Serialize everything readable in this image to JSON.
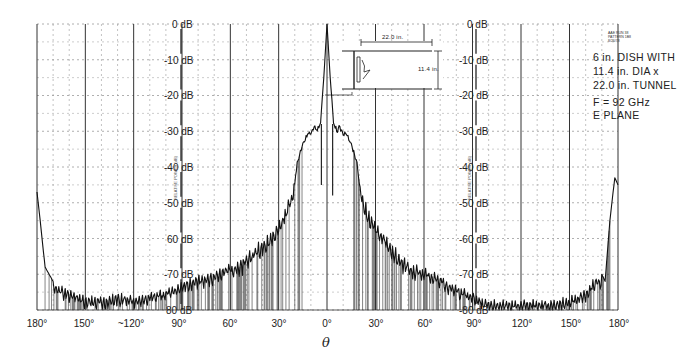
{
  "chart_data": {
    "type": "line",
    "xlabel": "θ",
    "ylabel": "RELATIVE POWER (dB)",
    "x_ticks": [
      "180°",
      "150°",
      "~120°",
      "90°",
      "60°",
      "30°",
      "0°",
      "30°",
      "60°",
      "90°",
      "120°",
      "150°",
      "180°"
    ],
    "y_ticks": [
      "0 dB",
      "-10 dB",
      "-20 dB",
      "-30 dB",
      "-40 dB",
      "-50 dB",
      "60 dB",
      "-70 dB",
      "80 dB"
    ],
    "y_ticks_right_column": [
      "0 dB",
      "-10 dB",
      "-20 dB",
      "-30 dB",
      "-40 dB",
      "-50 dB",
      "-60 dB",
      "-70 dB",
      "-80 dB"
    ],
    "xlim": [
      -180,
      180
    ],
    "ylim": [
      -80,
      0
    ],
    "grid": true,
    "legend": null,
    "annotations": {
      "description_lines": [
        "6 in. DISH WITH",
        "11.4 in. DIA x",
        "22.0 in. TUNNEL"
      ],
      "frequency": "F = 92 GHz",
      "plane": "E PLANE",
      "diagram_length": "22.0 in.",
      "diagram_diameter": "11.4 in."
    },
    "series": [
      {
        "name": "E plane pattern",
        "x": [
          -180,
          -178,
          -175,
          -170,
          -165,
          -160,
          -150,
          -140,
          -130,
          -120,
          -110,
          -100,
          -90,
          -85,
          -80,
          -75,
          -70,
          -65,
          -60,
          -55,
          -50,
          -45,
          -40,
          -35,
          -30,
          -25,
          -22,
          -20,
          -18,
          -15,
          -12,
          -10,
          -8,
          -6,
          -4,
          -2,
          0,
          2,
          4,
          6,
          8,
          10,
          12,
          15,
          18,
          20,
          22,
          25,
          30,
          35,
          40,
          45,
          50,
          55,
          60,
          65,
          70,
          75,
          80,
          85,
          90,
          100,
          110,
          120,
          130,
          140,
          150,
          160,
          165,
          170,
          172,
          175,
          178,
          180
        ],
        "values": [
          -47,
          -55,
          -68,
          -72,
          -73,
          -74,
          -76,
          -76,
          -75,
          -76,
          -75,
          -74,
          -72,
          -71,
          -70,
          -70,
          -69,
          -68,
          -67,
          -66,
          -64,
          -62,
          -60,
          -58,
          -55,
          -50,
          -47,
          -43,
          -37,
          -33,
          -30,
          -30,
          -28,
          -29,
          -27,
          -15,
          0,
          -15,
          -27,
          -29,
          -28,
          -30,
          -30,
          -33,
          -37,
          -43,
          -47,
          -51,
          -55,
          -58,
          -61,
          -64,
          -66,
          -67,
          -68,
          -69,
          -70,
          -72,
          -73,
          -74,
          -75,
          -77,
          -77,
          -77,
          -77,
          -77,
          -76,
          -74,
          -71,
          -70,
          -72,
          -55,
          -43,
          -45
        ]
      }
    ]
  },
  "figure": {
    "corner_stamp": [
      "AAE  RUN 38",
      "PATTERN 1B8",
      "8/26/78"
    ],
    "side_label": "RELATIVE POWER (dB)"
  }
}
